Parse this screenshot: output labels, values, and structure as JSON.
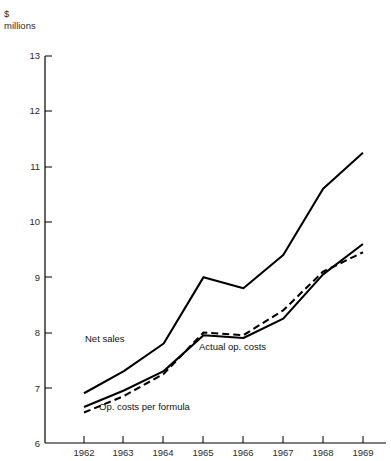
{
  "chart_data": {
    "type": "line",
    "title": "",
    "subtitle": "",
    "xlabel": "",
    "ylabel": "$ millions",
    "unit_line_1": "$",
    "unit_line_2": "millions",
    "x": [
      1962,
      1963,
      1964,
      1965,
      1966,
      1967,
      1968,
      1969
    ],
    "xtick_labels": [
      "1962",
      "1963",
      "1964",
      "1965",
      "1966",
      "1967",
      "1968",
      "1969"
    ],
    "ytick_labels": [
      "13",
      "12",
      "11",
      "10",
      "9",
      "8",
      "7",
      "6"
    ],
    "yticks": [
      13,
      12,
      11,
      10,
      9,
      8,
      7,
      6
    ],
    "ylim": [
      6,
      13
    ],
    "grid": false,
    "legend_position": "inline-annotations",
    "series": [
      {
        "name": "Net sales",
        "style": "solid",
        "color": "#000000",
        "values": [
          6.9,
          7.3,
          7.8,
          9.0,
          8.8,
          9.4,
          10.6,
          11.25
        ]
      },
      {
        "name": "Actual op. costs",
        "style": "solid",
        "color": "#000000",
        "values": [
          6.65,
          6.95,
          7.3,
          7.95,
          7.9,
          8.25,
          9.05,
          9.6
        ]
      },
      {
        "name": "Op. costs per formula",
        "style": "dashed",
        "color": "#000000",
        "values": [
          6.55,
          6.85,
          7.25,
          8.0,
          7.95,
          8.4,
          9.1,
          9.45
        ]
      }
    ],
    "annotations": [
      {
        "text": "Net sales",
        "x": 1962.9,
        "y": 7.55
      },
      {
        "text": "Actual op. costs",
        "x": 1965.2,
        "y": 7.4
      },
      {
        "text": "Op. costs per formula",
        "x": 1962.6,
        "y": 6.4
      }
    ]
  }
}
